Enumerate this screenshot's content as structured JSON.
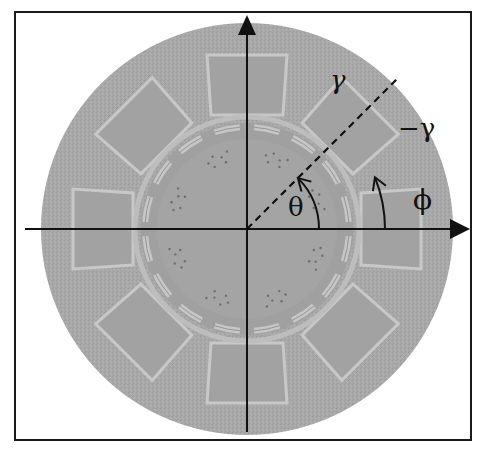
{
  "figure": {
    "frame": {
      "x": 15,
      "y": 12,
      "w": 456,
      "h": 428,
      "stroke": "#1a1a1a"
    },
    "center": {
      "x": 247,
      "y": 229
    },
    "outer_disk": {
      "radius": 206,
      "fill": "#a9a9a9"
    },
    "stator": {
      "tooth_count": 8,
      "tooth_start_angle_deg": 0,
      "tooth_step_deg": 45,
      "tooth_outer_radius": 174,
      "tooth_inner_radius": 114,
      "tooth_half_width": 36,
      "outline_color": "#c8c8c8"
    },
    "rotor": {
      "ring_radius": 102,
      "segment_count": 16,
      "inner_radius": 90,
      "fill": "#a4a4a4",
      "ring_color": "#c6c6c6"
    },
    "axes": {
      "x_axis": {
        "x1": 25,
        "x2": 470,
        "y": 229
      },
      "y_axis": {
        "x": 247,
        "y1": 432,
        "y2": 15
      },
      "color": "#111111"
    },
    "dashed_line": {
      "angle_deg": 45,
      "length": 215
    },
    "labels": {
      "gamma": "γ",
      "neg_gamma": "−γ",
      "theta": "θ",
      "phi": "ϕ"
    },
    "arcs": {
      "theta_arc": {
        "radius": 72,
        "from_deg": 0,
        "to_deg": 45
      },
      "phi_arc": {
        "radius": 138,
        "from_deg": 0,
        "to_deg": 22
      }
    }
  }
}
